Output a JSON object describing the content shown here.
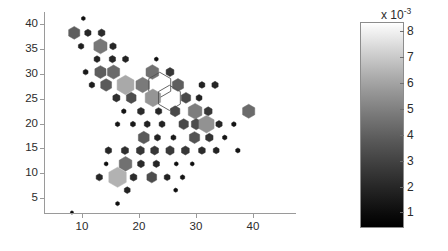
{
  "figure": {
    "background_color": "#ffffff",
    "axis_color": "#9a9a9a",
    "text_color": "#2b2b2b"
  },
  "chart_data": {
    "type": "scatter",
    "title": "",
    "xlabel": "",
    "ylabel": "",
    "xlim": [
      3.3,
      47.5
    ],
    "ylim": [
      2.0,
      42.5
    ],
    "xticks": [
      10,
      20,
      30,
      40
    ],
    "yticks": [
      5,
      10,
      15,
      20,
      25,
      30,
      35,
      40
    ],
    "xticklabels": [
      "10",
      "20",
      "30",
      "40"
    ],
    "yticklabels": [
      "5",
      "10",
      "15",
      "20",
      "25",
      "30",
      "35",
      "40"
    ],
    "grid": false,
    "legend": null,
    "marker_shape": "hexagon",
    "encoding": "marker size and gray fill both encode density value",
    "colorbar": {
      "orientation": "vertical",
      "colormap": "gray",
      "exponent_label": "x 10",
      "exponent_superscript": "-3",
      "ticks": [
        1,
        2,
        3,
        4,
        5,
        6,
        7,
        8
      ],
      "ticklabels": [
        "1",
        "2",
        "3",
        "4",
        "5",
        "6",
        "7",
        "8"
      ],
      "vmin": 0.4,
      "vmax": 8.35,
      "low_color": "#000000",
      "high_color": "#ffffff"
    },
    "points": [
      {
        "x": 10.2,
        "y": 41.2,
        "v": 0.6
      },
      {
        "x": 8.6,
        "y": 38.3,
        "v": 2.6
      },
      {
        "x": 11.0,
        "y": 38.3,
        "v": 1.1
      },
      {
        "x": 13.4,
        "y": 38.3,
        "v": 1.2
      },
      {
        "x": 9.8,
        "y": 35.6,
        "v": 0.9
      },
      {
        "x": 13.2,
        "y": 35.6,
        "v": 3.4
      },
      {
        "x": 15.4,
        "y": 35.6,
        "v": 1.1
      },
      {
        "x": 12.6,
        "y": 33.0,
        "v": 1.0
      },
      {
        "x": 15.3,
        "y": 33.0,
        "v": 1.1
      },
      {
        "x": 17.6,
        "y": 33.0,
        "v": 1.0
      },
      {
        "x": 23.0,
        "y": 33.0,
        "v": 0.6
      },
      {
        "x": 10.6,
        "y": 30.4,
        "v": 0.8
      },
      {
        "x": 13.2,
        "y": 30.4,
        "v": 2.6
      },
      {
        "x": 15.5,
        "y": 30.4,
        "v": 3.0
      },
      {
        "x": 22.3,
        "y": 30.4,
        "v": 3.2
      },
      {
        "x": 25.4,
        "y": 30.4,
        "v": 1.5
      },
      {
        "x": 11.7,
        "y": 27.8,
        "v": 0.9
      },
      {
        "x": 14.2,
        "y": 27.8,
        "v": 2.5
      },
      {
        "x": 17.6,
        "y": 27.8,
        "v": 5.1
      },
      {
        "x": 20.6,
        "y": 27.8,
        "v": 3.5
      },
      {
        "x": 23.6,
        "y": 27.8,
        "v": 7.9
      },
      {
        "x": 26.8,
        "y": 27.8,
        "v": 2.6
      },
      {
        "x": 31.0,
        "y": 27.8,
        "v": 1.0
      },
      {
        "x": 33.3,
        "y": 27.8,
        "v": 1.1
      },
      {
        "x": 16.0,
        "y": 25.2,
        "v": 1.3
      },
      {
        "x": 18.6,
        "y": 25.2,
        "v": 2.1
      },
      {
        "x": 22.4,
        "y": 25.2,
        "v": 4.4
      },
      {
        "x": 25.3,
        "y": 25.2,
        "v": 7.8
      },
      {
        "x": 28.2,
        "y": 25.2,
        "v": 2.0
      },
      {
        "x": 30.5,
        "y": 25.2,
        "v": 1.0
      },
      {
        "x": 17.3,
        "y": 22.5,
        "v": 0.7
      },
      {
        "x": 20.3,
        "y": 22.5,
        "v": 1.2
      },
      {
        "x": 23.4,
        "y": 22.5,
        "v": 1.1
      },
      {
        "x": 26.3,
        "y": 22.5,
        "v": 2.0
      },
      {
        "x": 29.8,
        "y": 22.5,
        "v": 3.6
      },
      {
        "x": 32.1,
        "y": 22.5,
        "v": 1.5
      },
      {
        "x": 39.2,
        "y": 22.5,
        "v": 3.0
      },
      {
        "x": 16.2,
        "y": 19.9,
        "v": 0.7
      },
      {
        "x": 18.9,
        "y": 19.9,
        "v": 0.8
      },
      {
        "x": 21.4,
        "y": 19.9,
        "v": 1.0
      },
      {
        "x": 24.0,
        "y": 19.9,
        "v": 1.0
      },
      {
        "x": 27.8,
        "y": 19.9,
        "v": 2.0
      },
      {
        "x": 30.0,
        "y": 19.9,
        "v": 2.1
      },
      {
        "x": 31.8,
        "y": 19.9,
        "v": 4.3
      },
      {
        "x": 34.0,
        "y": 19.9,
        "v": 1.1
      },
      {
        "x": 36.6,
        "y": 19.9,
        "v": 0.7
      },
      {
        "x": 20.8,
        "y": 17.2,
        "v": 2.5
      },
      {
        "x": 23.2,
        "y": 17.2,
        "v": 1.0
      },
      {
        "x": 26.0,
        "y": 17.2,
        "v": 0.8
      },
      {
        "x": 29.7,
        "y": 17.2,
        "v": 2.3
      },
      {
        "x": 32.3,
        "y": 17.2,
        "v": 1.4
      },
      {
        "x": 35.0,
        "y": 17.2,
        "v": 0.7
      },
      {
        "x": 14.6,
        "y": 14.6,
        "v": 1.1
      },
      {
        "x": 17.5,
        "y": 14.6,
        "v": 1.3
      },
      {
        "x": 20.2,
        "y": 14.6,
        "v": 1.5
      },
      {
        "x": 22.7,
        "y": 14.6,
        "v": 1.5
      },
      {
        "x": 25.4,
        "y": 14.6,
        "v": 1.6
      },
      {
        "x": 28.1,
        "y": 14.6,
        "v": 1.5
      },
      {
        "x": 31.0,
        "y": 14.6,
        "v": 1.2
      },
      {
        "x": 33.5,
        "y": 14.6,
        "v": 1.0
      },
      {
        "x": 37.3,
        "y": 14.6,
        "v": 0.7
      },
      {
        "x": 14.2,
        "y": 11.9,
        "v": 0.6
      },
      {
        "x": 17.6,
        "y": 11.9,
        "v": 3.2
      },
      {
        "x": 20.3,
        "y": 11.9,
        "v": 1.2
      },
      {
        "x": 23.0,
        "y": 11.9,
        "v": 1.1
      },
      {
        "x": 26.5,
        "y": 11.9,
        "v": 0.6
      },
      {
        "x": 29.3,
        "y": 11.9,
        "v": 0.6
      },
      {
        "x": 13.0,
        "y": 9.2,
        "v": 1.1
      },
      {
        "x": 16.2,
        "y": 9.2,
        "v": 5.4
      },
      {
        "x": 19.0,
        "y": 9.2,
        "v": 1.2
      },
      {
        "x": 22.2,
        "y": 9.2,
        "v": 2.1
      },
      {
        "x": 24.9,
        "y": 9.2,
        "v": 1.0
      },
      {
        "x": 27.6,
        "y": 9.2,
        "v": 0.7
      },
      {
        "x": 17.9,
        "y": 6.6,
        "v": 1.0
      },
      {
        "x": 26.4,
        "y": 6.6,
        "v": 0.6
      },
      {
        "x": 16.2,
        "y": 3.9,
        "v": 0.6
      },
      {
        "x": 8.2,
        "y": 2.1,
        "v": 0.5
      }
    ]
  }
}
